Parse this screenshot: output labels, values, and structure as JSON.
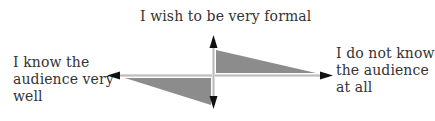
{
  "diagram": {
    "top_label": "I wish to be very formal",
    "left_label": "I know the\naudience very\nwell",
    "right_label": "I do not know\nthe audience\nat all",
    "colors": {
      "axis": "#111111",
      "axis_highlight": "#d8d8d8",
      "triangle_fill": "#8c8c8c",
      "text": "#333333"
    },
    "elements": [
      {
        "type": "horizontal-axis",
        "direction": "bidirectional arrow"
      },
      {
        "type": "vertical-axis",
        "direction": "bidirectional arrow"
      },
      {
        "type": "triangle",
        "position": "upper-right quadrant"
      },
      {
        "type": "triangle",
        "position": "lower-left quadrant"
      }
    ]
  }
}
